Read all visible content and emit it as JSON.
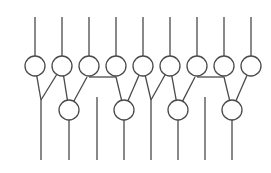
{
  "diagram": {
    "type": "circuit-network",
    "colors": {
      "stroke": "#4a4a4a",
      "background": "#ffffff"
    },
    "node_radius": 10,
    "top_row": {
      "y": 66,
      "input_top_y": 17,
      "nodes_x": [
        35,
        62,
        89,
        116,
        143,
        170,
        197,
        224,
        251
      ]
    },
    "bottom_row": {
      "y": 110,
      "output_bottom_y": 160,
      "nodes_x": [
        69,
        124,
        178,
        232
      ]
    },
    "junctions": [
      {
        "x": 41,
        "y": 100,
        "bottom_y": 160
      },
      {
        "x": 151,
        "y": 100,
        "bottom_y": 160
      }
    ],
    "standalone_wires": [
      {
        "x": 97,
        "top_y": 97,
        "bottom_y": 160
      },
      {
        "x": 205,
        "top_y": 97,
        "bottom_y": 160
      }
    ],
    "horizontal_links": [
      {
        "x1": 89,
        "x2": 116,
        "y": 77
      },
      {
        "x1": 197,
        "x2": 224,
        "y": 77
      }
    ]
  }
}
